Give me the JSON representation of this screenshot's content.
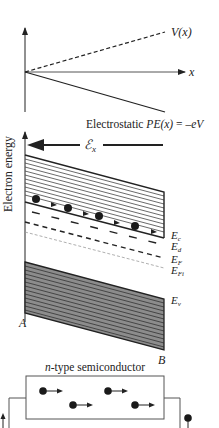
{
  "top_plot": {
    "v_label": "V(x)",
    "x_label": "x",
    "pe_label_prefix": "Electrostatic ",
    "pe_label_italic": "PE(x)",
    "pe_label_suffix": " = –",
    "pe_label_tail": "eV"
  },
  "band_diagram": {
    "y_axis_label": "Electron energy",
    "field_label": "ℰ",
    "field_sub": "x",
    "levels": {
      "ec": {
        "main": "E",
        "sub": "c"
      },
      "ed": {
        "main": "E",
        "sub": "d"
      },
      "ef": {
        "main": "E",
        "sub": "F"
      },
      "efi": {
        "main": "E",
        "sub": "Fi"
      },
      "ev": {
        "main": "E",
        "sub": "v"
      }
    },
    "point_a": "A",
    "point_b": "B"
  },
  "semiconductor": {
    "title_italic": "n",
    "title_rest": "-type semiconductor"
  },
  "colors": {
    "line": "#222222",
    "valence_fill": "#8c8c8c",
    "efi_line": "#9a9a9a"
  }
}
